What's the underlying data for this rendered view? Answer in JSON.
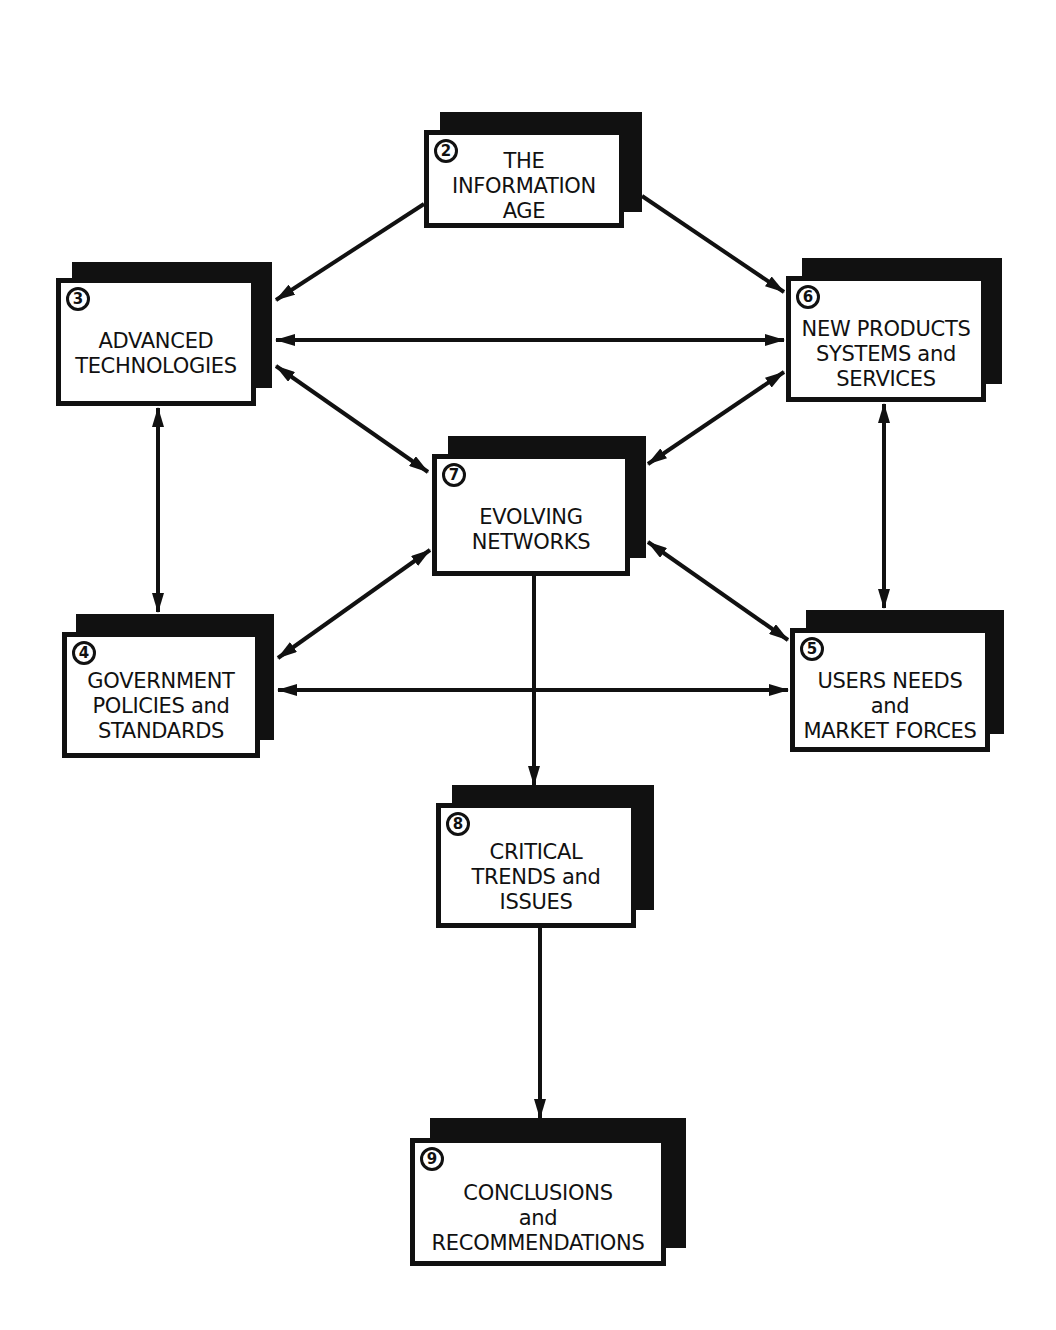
{
  "diagram": {
    "colors": {
      "ink": "#111111",
      "paper": "#ffffff"
    },
    "nodes": [
      {
        "id": "2",
        "number": "2",
        "lines": [
          "THE",
          "INFORMATION",
          "AGE"
        ]
      },
      {
        "id": "3",
        "number": "3",
        "lines": [
          "ADVANCED",
          "TECHNOLOGIES"
        ]
      },
      {
        "id": "6",
        "number": "6",
        "lines": [
          "NEW PRODUCTS",
          "SYSTEMS and",
          "SERVICES"
        ]
      },
      {
        "id": "7",
        "number": "7",
        "lines": [
          "EVOLVING",
          "NETWORKS"
        ]
      },
      {
        "id": "4",
        "number": "4",
        "lines": [
          "GOVERNMENT",
          "POLICIES and",
          "STANDARDS"
        ]
      },
      {
        "id": "5",
        "number": "5",
        "lines": [
          "USERS NEEDS",
          "and",
          "MARKET FORCES"
        ]
      },
      {
        "id": "8",
        "number": "8",
        "lines": [
          "CRITICAL",
          "TRENDS and",
          "ISSUES"
        ]
      },
      {
        "id": "9",
        "number": "9",
        "lines": [
          "CONCLUSIONS",
          "and",
          "RECOMMENDATIONS"
        ]
      }
    ],
    "edges": [
      {
        "from": "2",
        "to": "3",
        "direction": "one-way"
      },
      {
        "from": "2",
        "to": "6",
        "direction": "one-way"
      },
      {
        "from": "3",
        "to": "6",
        "direction": "two-way"
      },
      {
        "from": "3",
        "to": "7",
        "direction": "two-way"
      },
      {
        "from": "6",
        "to": "7",
        "direction": "two-way"
      },
      {
        "from": "3",
        "to": "4",
        "direction": "two-way"
      },
      {
        "from": "6",
        "to": "5",
        "direction": "two-way"
      },
      {
        "from": "7",
        "to": "4",
        "direction": "two-way"
      },
      {
        "from": "7",
        "to": "5",
        "direction": "two-way"
      },
      {
        "from": "4",
        "to": "5",
        "direction": "two-way"
      },
      {
        "from": "7",
        "to": "8",
        "direction": "one-way"
      },
      {
        "from": "8",
        "to": "9",
        "direction": "one-way"
      }
    ]
  }
}
